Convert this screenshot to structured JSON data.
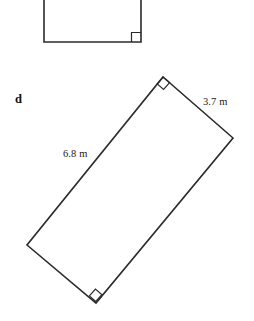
{
  "figure": {
    "part_label": "d",
    "background_color": "#ffffff",
    "stroke_color": "#2b2b2b",
    "text_color": "#1a1a1a",
    "top_shape": {
      "name": "partial-rectangle-cropped",
      "description": "rectangle cropped by top edge of image",
      "left_x": 44,
      "right_x": 141,
      "bottom_y": 42,
      "top_y": -6,
      "right_angle_marker": {
        "x": 128,
        "y": 31,
        "size": 9
      }
    },
    "main_shape": {
      "name": "rotated-rectangle",
      "vertices": [
        {
          "name": "top",
          "x": 163,
          "y": 77
        },
        {
          "name": "right",
          "x": 233,
          "y": 138
        },
        {
          "name": "bottom",
          "x": 96,
          "y": 303
        },
        {
          "name": "left",
          "x": 27,
          "y": 245
        }
      ],
      "right_angle_markers": [
        {
          "at_vertex": "top",
          "size": 9
        },
        {
          "at_vertex": "bottom",
          "size": 9
        }
      ]
    },
    "dimensions": [
      {
        "name": "width-label",
        "value": "3.7 m",
        "edge": "top-right",
        "x": 203,
        "y": 105
      },
      {
        "name": "length-label",
        "value": "6.8 m",
        "edge": "top-left",
        "x": 63,
        "y": 157
      }
    ],
    "part_label_pos": {
      "x": 15,
      "y": 103
    }
  }
}
